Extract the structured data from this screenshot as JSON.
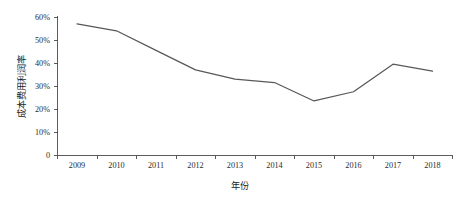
{
  "chart_data": {
    "type": "line",
    "title": "",
    "xlabel": "年份",
    "ylabel": "成本费用利润率",
    "categories": [
      "2009",
      "2010",
      "2011",
      "2012",
      "2013",
      "2014",
      "2015",
      "2016",
      "2017",
      "2018"
    ],
    "x": [
      2009,
      2010,
      2011,
      2012,
      2013,
      2014,
      2015,
      2016,
      2017,
      2018
    ],
    "values": [
      57.0,
      54.0,
      45.5,
      37.0,
      33.0,
      31.5,
      23.5,
      27.5,
      39.5,
      36.5
    ],
    "series": [
      {
        "name": "成本费用利润率",
        "values": [
          57.0,
          54.0,
          45.5,
          37.0,
          33.0,
          31.5,
          23.5,
          27.5,
          39.5,
          36.5
        ]
      }
    ],
    "unit": "%",
    "ylim": [
      0,
      60
    ],
    "ytick_values": [
      0,
      10,
      20,
      30,
      40,
      50,
      60
    ],
    "ytick_labels": [
      "0",
      "10%",
      "20%",
      "30%",
      "40%",
      "50%",
      "60%"
    ],
    "xtick_labels": [
      "2009",
      "2010",
      "2011",
      "2012",
      "2013",
      "2014",
      "2015",
      "2016",
      "2017",
      "2018"
    ],
    "grid": false,
    "legend": false,
    "legend_position": "none",
    "line_color": "#58585a",
    "axis_color": "#4a4a4a",
    "background_color": "#ffffff"
  },
  "axes": {
    "y_title": "成本费用利润率",
    "x_title": "年份"
  }
}
